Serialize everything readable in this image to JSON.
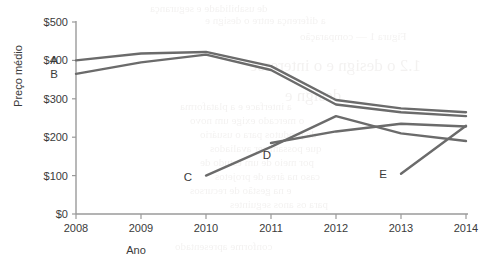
{
  "chart_data": {
    "type": "line",
    "title": "",
    "xlabel": "Ano",
    "ylabel": "Preço médio",
    "x": [
      2008,
      2009,
      2010,
      2011,
      2012,
      2013,
      2014
    ],
    "xtick_labels": [
      "2008",
      "2009",
      "2010",
      "2011",
      "2012",
      "2013",
      "2014"
    ],
    "ytick_labels": [
      "$0",
      "$100",
      "$200",
      "$300",
      "$400",
      "$500"
    ],
    "yticks": [
      0,
      100,
      200,
      300,
      400,
      500
    ],
    "ylim": [
      0,
      500
    ],
    "xlim": [
      2008,
      2014
    ],
    "grid": false,
    "legend": "inline-end-labels",
    "line_color": "#6b6b6b",
    "axis_color": "#9a9a9a",
    "series": [
      {
        "name": "A",
        "label": "A",
        "x": [
          2008,
          2009,
          2010,
          2011,
          2012,
          2013,
          2014
        ],
        "values": [
          400,
          418,
          422,
          385,
          297,
          275,
          265
        ]
      },
      {
        "name": "B",
        "label": "B",
        "x": [
          2008,
          2009,
          2010,
          2011,
          2012,
          2013,
          2014
        ],
        "values": [
          365,
          395,
          415,
          375,
          285,
          265,
          255
        ]
      },
      {
        "name": "C",
        "label": "C",
        "x": [
          2010,
          2011,
          2012,
          2013,
          2014
        ],
        "values": [
          100,
          175,
          255,
          210,
          190
        ]
      },
      {
        "name": "D",
        "label": "D",
        "x": [
          2011,
          2012,
          2013,
          2014
        ],
        "values": [
          185,
          215,
          235,
          228
        ]
      },
      {
        "name": "E",
        "label": "E",
        "x": [
          2013,
          2014
        ],
        "values": [
          105,
          230
        ]
      }
    ],
    "series_label_positions": [
      {
        "name": "A",
        "x": 2008,
        "value": 400,
        "dx": -22,
        "dy": 4
      },
      {
        "name": "B",
        "x": 2008,
        "value": 365,
        "dx": -22,
        "dy": 4
      },
      {
        "name": "C",
        "x": 2010,
        "value": 100,
        "dx": -18,
        "dy": 5
      },
      {
        "name": "D",
        "x": 2011,
        "value": 185,
        "dx": -4,
        "dy": 16
      },
      {
        "name": "E",
        "x": 2013,
        "value": 105,
        "dx": -18,
        "dy": 4
      }
    ]
  },
  "ghost_text": {
    "lines": [
      {
        "text": "de usabilidade e segurança",
        "x": 150,
        "y": 2,
        "size": 11
      },
      {
        "text": "a diferença entre o design e",
        "x": 205,
        "y": 14,
        "size": 11
      },
      {
        "text": "Figura 1 — comparação",
        "x": 300,
        "y": 30,
        "size": 11
      },
      {
        "text": "1.2 o design e o interesse",
        "x": 250,
        "y": 56,
        "size": 17
      },
      {
        "text": "design e",
        "x": 285,
        "y": 86,
        "size": 17
      },
      {
        "text": "a interface e a plataforma",
        "x": 180,
        "y": 100,
        "size": 11
      },
      {
        "text": "o mercado exige um novo",
        "x": 190,
        "y": 114,
        "size": 11
      },
      {
        "text": "de produtos para o usuário",
        "x": 200,
        "y": 128,
        "size": 11
      },
      {
        "text": "que possam ser avaliados",
        "x": 210,
        "y": 142,
        "size": 11
      },
      {
        "text": "por meio de um estudo de",
        "x": 200,
        "y": 156,
        "size": 11
      },
      {
        "text": "caso na área de projetos",
        "x": 215,
        "y": 170,
        "size": 11
      },
      {
        "text": "e na gestão de recursos",
        "x": 190,
        "y": 184,
        "size": 11
      },
      {
        "text": "para os anos seguintes",
        "x": 230,
        "y": 198,
        "size": 11
      },
      {
        "text": "conforme apresentado",
        "x": 175,
        "y": 240,
        "size": 11
      }
    ]
  }
}
